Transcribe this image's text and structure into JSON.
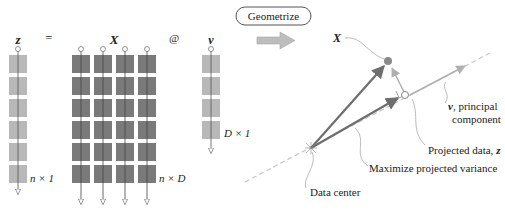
{
  "equation": {
    "z_label": "z",
    "equals": "=",
    "x_label": "X",
    "at": "@",
    "v_label": "v",
    "z_shape": "n × 1",
    "x_shape": "n × D",
    "v_shape": "D × 1"
  },
  "geometrize_button": "Geometrize",
  "geometry": {
    "x_label": "X",
    "v_label_main": "v",
    "v_label_suffix": ", principal",
    "v_label_line2": "component",
    "projected_label": "Projected data, ",
    "projected_var": "z",
    "variance_label": "Maximize projected variance",
    "center_label": "Data center"
  },
  "colors": {
    "light_block": "#b8b8b8",
    "dark_block": "#7a7a7a",
    "arrow_dark": "#6e6e6e",
    "arrow_light": "#b0b0b0",
    "point": "#8a8a8a"
  }
}
